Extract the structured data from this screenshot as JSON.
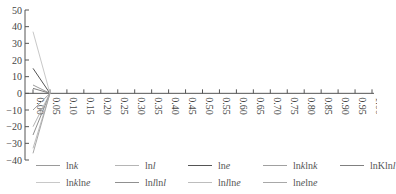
{
  "chart_data": {
    "type": "line",
    "title": "",
    "xlabel": "",
    "ylabel": "",
    "xlim": [
      0.0,
      1.0
    ],
    "ylim": [
      -40,
      50
    ],
    "grid": false,
    "x_ticks": [
      "0.00",
      "0.05",
      "0.10",
      "0.15",
      "0.20",
      "0.25",
      "0.30",
      "0.35",
      "0.40",
      "0.45",
      "0.50",
      "0.55",
      "0.60",
      "0.65",
      "0.70",
      "0.75",
      "0.80",
      "0.85",
      "0.90",
      "0.95",
      "1.00"
    ],
    "y_ticks": [
      "50",
      "40",
      "30",
      "20",
      "10",
      "0",
      "−10",
      "−20",
      "−30",
      "−40"
    ],
    "legend_position": "bottom",
    "series": [
      {
        "name": "lnk",
        "label_html": "ln<i>k</i>",
        "color": "#9a9a9a",
        "x": [
          0.0,
          0.05
        ],
        "y": [
          5,
          0
        ]
      },
      {
        "name": "lnl",
        "label_html": "ln<i>l</i>",
        "color": "#b5b5b5",
        "x": [
          0.0,
          0.05
        ],
        "y": [
          -20,
          0
        ]
      },
      {
        "name": "lne",
        "label_html": "ln<i>e</i>",
        "color": "#555555",
        "x": [
          0.0,
          0.05
        ],
        "y": [
          15,
          0
        ]
      },
      {
        "name": "lnklnk",
        "label_html": "ln<i>k</i>ln<i>k</i>",
        "color": "#a0a0a0",
        "x": [
          0.0,
          0.05
        ],
        "y": [
          -10,
          0
        ]
      },
      {
        "name": "lnKlnl",
        "label_html": "lnKln<i>l</i>",
        "color": "#808080",
        "x": [
          0.0,
          0.05
        ],
        "y": [
          3,
          0
        ]
      },
      {
        "name": "lnklne",
        "label_html": "ln<i>k</i>ln<i>e</i>",
        "color": "#c8c8c8",
        "x": [
          0.0,
          0.05
        ],
        "y": [
          37,
          0
        ]
      },
      {
        "name": "lnllnl",
        "label_html": "ln<i>l</i>ln<i>l</i>",
        "color": "#909090",
        "x": [
          0.0,
          0.05
        ],
        "y": [
          -25,
          0
        ]
      },
      {
        "name": "lnllne",
        "label_html": "ln<i>l</i>ln<i>e</i>",
        "color": "#bdbdbd",
        "x": [
          0.0,
          0.05
        ],
        "y": [
          -33,
          0
        ]
      },
      {
        "name": "lnelne",
        "label_html": "ln<i>e</i>ln<i>e</i>",
        "color": "#a8a8a8",
        "x": [
          0.0,
          0.05
        ],
        "y": [
          -36,
          0
        ]
      }
    ]
  }
}
